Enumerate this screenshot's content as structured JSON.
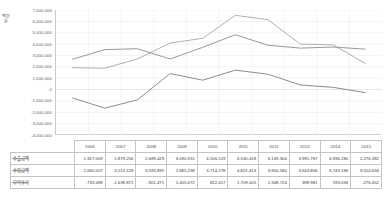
{
  "axis": {
    "y_unit_label": "백만원",
    "y_ticks": [
      "7,000,000",
      "6,000,000",
      "5,000,000",
      "4,000,000",
      "3,000,000",
      "2,000,000",
      "1,000,000",
      "0",
      "-1,000,000",
      "-2,000,000",
      "-3,000,000",
      "-4,000,000"
    ]
  },
  "legend": {
    "exports": "수출금액",
    "imports": "수입금액",
    "balance": "무역수지"
  },
  "table": {
    "corner": "",
    "years": [
      "2006",
      "2007",
      "2008",
      "2009",
      "2010",
      "2011",
      "2012",
      "2013",
      "2014",
      "2015"
    ],
    "rows": [
      {
        "label": "수출금액",
        "values": [
          "1,927,009",
          "1,879,256",
          "2,689,429",
          "4,090,910",
          "4,506,519",
          "6,530,418",
          "6,149,304",
          "3,991,787",
          "3,936,280",
          "2,276,382"
        ]
      },
      {
        "label": "수입금액",
        "values": [
          "2,660,507",
          "3,513,128",
          "3,593,895",
          "2,685,238",
          "3,714,278",
          "4,821,413",
          "3,900,580",
          "3,643,806",
          "3,743,186",
          "9,550,634"
        ]
      },
      {
        "label": "무역수지",
        "values": [
          "-733,498",
          "-1,638,872",
          "-901,471",
          "1,405,672",
          "822,417",
          "1,709,005",
          "1,348,724",
          "398,981",
          "193,094",
          "-276,452"
        ]
      }
    ]
  },
  "chart_data": {
    "type": "line",
    "title": "",
    "xlabel": "",
    "ylabel": "백만원",
    "categories": [
      "2006",
      "2007",
      "2008",
      "2009",
      "2010",
      "2011",
      "2012",
      "2013",
      "2014",
      "2015"
    ],
    "ylim": [
      -4000000,
      7000000
    ],
    "ytick_step": 1000000,
    "grid": true,
    "legend_position": "table-left",
    "series": [
      {
        "name": "수출금액",
        "color": "#a6a6a6",
        "values": [
          1927009,
          1879256,
          2689429,
          4090910,
          4506519,
          6530418,
          6149304,
          3991787,
          3936280,
          2276382
        ]
      },
      {
        "name": "수입금액",
        "color": "#8c8c8c",
        "values": [
          2660507,
          3513128,
          3593895,
          2685238,
          3714278,
          4821413,
          3900580,
          3643806,
          3743186,
          3550634
        ]
      },
      {
        "name": "무역수지",
        "color": "#808080",
        "values": [
          -733498,
          -1638872,
          -901471,
          1405672,
          822417,
          1709005,
          1348724,
          398981,
          193094,
          -276452
        ]
      }
    ]
  }
}
